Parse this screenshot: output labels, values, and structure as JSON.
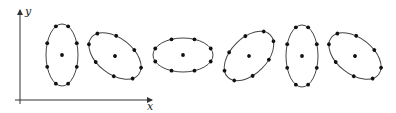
{
  "diagram": {
    "axes": {
      "x_label": "x",
      "y_label": "y",
      "origin": [
        20,
        100
      ],
      "x_end": [
        152,
        100
      ],
      "y_end": [
        20,
        10
      ]
    },
    "ellipses": [
      {
        "id": 1,
        "cx": 62,
        "cy": 55,
        "rx": 16,
        "ry": 31,
        "rotation": 0,
        "points": 8,
        "has_center_dot": true
      },
      {
        "id": 2,
        "cx": 115,
        "cy": 56,
        "rx": 30,
        "ry": 18,
        "rotation": 38,
        "points": 8,
        "has_center_dot": true
      },
      {
        "id": 3,
        "cx": 183,
        "cy": 55,
        "rx": 30,
        "ry": 17,
        "rotation": 0,
        "points": 8,
        "has_center_dot": true
      },
      {
        "id": 4,
        "cx": 249,
        "cy": 56,
        "rx": 30,
        "ry": 18,
        "rotation": -45,
        "points": 8,
        "has_center_dot": true
      },
      {
        "id": 5,
        "cx": 302,
        "cy": 56,
        "rx": 16,
        "ry": 31,
        "rotation": 0,
        "points": 8,
        "has_center_dot": true
      },
      {
        "id": 6,
        "cx": 355,
        "cy": 56,
        "rx": 30,
        "ry": 18,
        "rotation": 38,
        "points": 8,
        "has_center_dot": true
      }
    ],
    "colors": {
      "stroke": "#444444",
      "dot": "#111111",
      "background": "#ffffff"
    }
  }
}
